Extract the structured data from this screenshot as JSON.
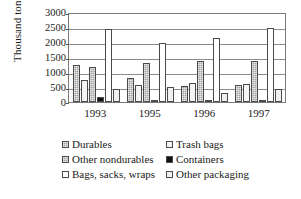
{
  "chart_data": {
    "type": "bar",
    "title": "",
    "xlabel": "",
    "ylabel": "Thousand tons",
    "ylim": [
      0,
      3000
    ],
    "yticks": [
      3000,
      2500,
      2000,
      1500,
      1000,
      500,
      0
    ],
    "grid": true,
    "legend_position": "bottom",
    "categories": [
      "1993",
      "1995",
      "1996",
      "1997"
    ],
    "series": [
      {
        "name": "Durables",
        "pattern": "grey-grid",
        "values": [
          1230,
          790,
          540,
          580
        ]
      },
      {
        "name": "Trash bags",
        "pattern": "light-dotted",
        "values": [
          730,
          555,
          620,
          600
        ]
      },
      {
        "name": "Other nondurables",
        "pattern": "grey-grid",
        "values": [
          1160,
          1300,
          1360,
          1360
        ]
      },
      {
        "name": "Containers",
        "pattern": "solid-black",
        "values": [
          180,
          30,
          30,
          30
        ]
      },
      {
        "name": "Bags, sacks, wraps",
        "pattern": "white",
        "values": [
          2450,
          1960,
          2150,
          2460
        ]
      },
      {
        "name": "Other packaging",
        "pattern": "dotted",
        "values": [
          450,
          500,
          300,
          440
        ]
      }
    ]
  },
  "axis": {
    "y_title": "Thousand tons"
  },
  "colors": {
    "axis": "#7a7a7a",
    "grid": "#8c8c8c",
    "bar_outline": "#4a4a4a",
    "containers": "#111111",
    "durables": "#9e9e9e",
    "other_nondurables": "#a4a4a4",
    "trash_bags": "#f4f4f4",
    "bags_sacks_wraps": "#ffffff",
    "other_packaging": "#f0f0f0"
  }
}
